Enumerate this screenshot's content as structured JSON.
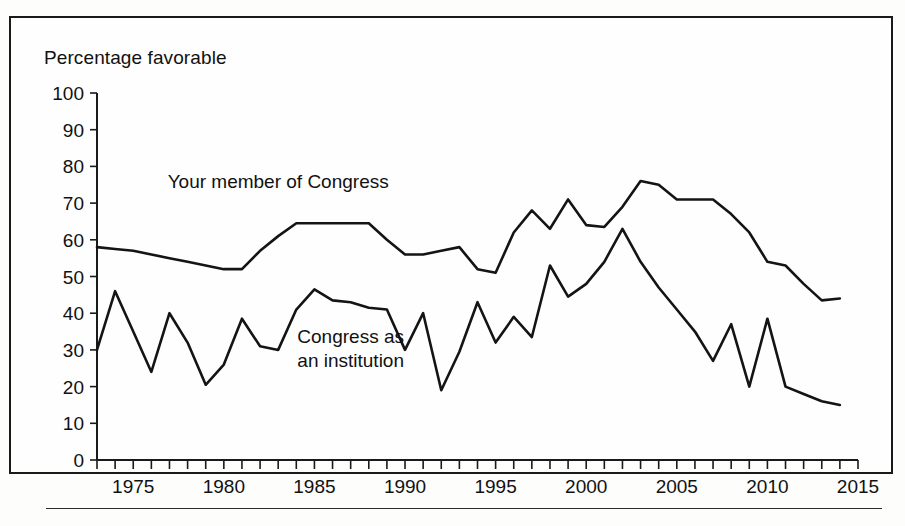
{
  "figure": {
    "axis_title": "Percentage favorable",
    "frame": "rectangular-border"
  },
  "chart_data": {
    "type": "line",
    "title": "",
    "subtitle": "",
    "xlabel": "",
    "ylabel": "Percentage favorable",
    "xlim": [
      1973,
      2015
    ],
    "ylim": [
      0,
      100
    ],
    "grid": false,
    "legend_position": "inline-annotation",
    "y_ticks": [
      0,
      10,
      20,
      30,
      40,
      50,
      60,
      70,
      80,
      90,
      100
    ],
    "y_tick_labels": [
      "0",
      "10",
      "20",
      "30",
      "40",
      "50",
      "60",
      "70",
      "80",
      "90",
      "100"
    ],
    "x_ticks": [
      1975,
      1980,
      1985,
      1990,
      1995,
      2000,
      2005,
      2010,
      2015
    ],
    "x_tick_labels": [
      "1975",
      "1980",
      "1985",
      "1990",
      "1995",
      "2000",
      "2005",
      "2010",
      "2015"
    ],
    "x_minor_tick_interval": 1,
    "x": [
      1973,
      1974,
      1975,
      1976,
      1977,
      1978,
      1979,
      1980,
      1981,
      1982,
      1983,
      1984,
      1985,
      1986,
      1987,
      1988,
      1989,
      1990,
      1991,
      1992,
      1993,
      1994,
      1995,
      1996,
      1997,
      1998,
      1999,
      2000,
      2001,
      2002,
      2003,
      2004,
      2005,
      2006,
      2007,
      2008,
      2009,
      2010,
      2011,
      2012,
      2013,
      2014
    ],
    "series": [
      {
        "name": "Your member of Congress",
        "annotation": "Your member of Congress",
        "annotation_x": 1983,
        "annotation_y": 74,
        "values": [
          58,
          57.5,
          57,
          56,
          55,
          54,
          53,
          52,
          52,
          57,
          61,
          64.5,
          64.5,
          64.5,
          64.5,
          64.5,
          60,
          56,
          56,
          57,
          58,
          52,
          51,
          62,
          68,
          63,
          71,
          64,
          63.5,
          69,
          76,
          75,
          71,
          71,
          71,
          67,
          62,
          54,
          53,
          48,
          43.5,
          44
        ]
      },
      {
        "name": "Congress as an institution",
        "annotation_line1": "Congress as",
        "annotation_line2": "an institution",
        "annotation_x": 1987,
        "annotation_y": 32,
        "values": [
          30,
          46,
          35,
          24,
          40,
          32,
          20.5,
          26,
          38.5,
          31,
          30,
          41,
          46.5,
          43.5,
          43,
          41.5,
          41,
          30,
          40,
          19,
          29.5,
          43,
          32,
          39,
          33.5,
          53,
          44.5,
          48,
          54,
          63,
          54,
          47,
          41,
          35,
          27,
          37,
          20,
          38.5,
          20,
          18,
          16,
          15
        ]
      }
    ]
  },
  "axes_geometry": {
    "plot_left": 97,
    "plot_right": 858,
    "plot_top": 93,
    "plot_bottom": 460
  }
}
